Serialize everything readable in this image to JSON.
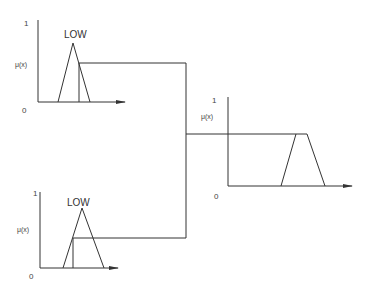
{
  "diagram": {
    "type": "fuzzy-inference-max-aggregation",
    "input_top": {
      "y_axis_max": "1",
      "y_axis_label": "μ(x)",
      "y_axis_min": "0",
      "term_label": "LOW"
    },
    "input_bottom": {
      "y_axis_max": "1",
      "y_axis_label": "μ(x)",
      "y_axis_min": "0",
      "term_label": "LOW"
    },
    "output": {
      "y_axis_max": "1",
      "y_axis_label": "μ(x)",
      "y_axis_min": "0"
    },
    "colors": {
      "line": "#333333",
      "background": "#ffffff"
    }
  }
}
